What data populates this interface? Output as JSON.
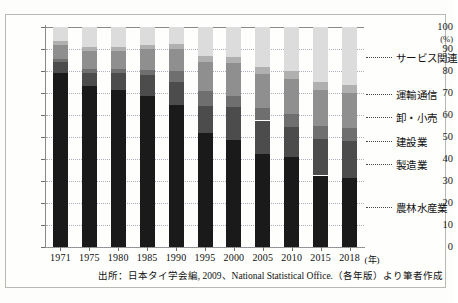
{
  "chart_data": {
    "type": "bar",
    "subtype": "stacked-percentage-column",
    "title": "",
    "xlabel": "(年)",
    "ylabel": "(%)",
    "ylim": [
      0,
      100
    ],
    "yticks": [
      0,
      10,
      20,
      30,
      40,
      50,
      60,
      70,
      80,
      90,
      100
    ],
    "ytick_labels": [
      "0",
      "10",
      "20",
      "30",
      "40",
      "50",
      "60",
      "70",
      "80",
      "90",
      "100"
    ],
    "grid": true,
    "legend_position": "right",
    "categories": [
      "1971",
      "1975",
      "1980",
      "1985",
      "1990",
      "1995",
      "2000",
      "2005",
      "2010",
      "2015",
      "2018"
    ],
    "series": [
      {
        "name": "農林水産業",
        "color": "#1a1a1a",
        "values": [
          79.0,
          73.0,
          71.5,
          68.5,
          64.5,
          52.0,
          48.5,
          42.5,
          41.0,
          32.5,
          31.5
        ]
      },
      {
        "name": "製造業",
        "color": "#4c4c4c",
        "values": [
          5.0,
          6.0,
          7.5,
          9.5,
          10.5,
          12.0,
          15.0,
          15.0,
          13.5,
          16.5,
          16.5
        ]
      },
      {
        "name": "建設業",
        "color": "#6f6f6f",
        "values": [
          1.5,
          2.0,
          2.0,
          2.5,
          5.0,
          7.0,
          5.0,
          5.5,
          6.0,
          6.0,
          6.0
        ]
      },
      {
        "name": "卸・小売",
        "color": "#8f8f8f",
        "values": [
          6.5,
          8.0,
          8.0,
          9.5,
          10.0,
          13.0,
          15.0,
          15.5,
          16.0,
          16.5,
          16.0
        ]
      },
      {
        "name": "運輸通信",
        "color": "#b0b0b0",
        "values": [
          1.5,
          2.0,
          2.0,
          2.0,
          2.5,
          3.0,
          3.0,
          3.5,
          3.5,
          3.5,
          3.5
        ]
      },
      {
        "name": "サービス関連",
        "color": "#dcdcdc",
        "values": [
          6.5,
          9.0,
          9.0,
          8.0,
          7.5,
          13.0,
          13.5,
          18.0,
          20.0,
          25.0,
          26.5
        ]
      }
    ]
  },
  "axis": {
    "y_unit": "(%)",
    "x_unit": "(年)"
  },
  "legend": {
    "items": [
      {
        "label": "サービス関連",
        "top": 50
      },
      {
        "label": "運輸通信",
        "top": 87
      },
      {
        "label": "卸・小売",
        "top": 110
      },
      {
        "label": "建設業",
        "top": 134
      },
      {
        "label": "製造業",
        "top": 157
      },
      {
        "label": "農林水産業",
        "top": 200
      }
    ]
  },
  "source": {
    "prefix": "出所：日本タイ学会編",
    "year": "2009",
    "separator": "、",
    "org": "National Statistical Office.",
    "suffix": "（各年版）より筆者作成"
  }
}
